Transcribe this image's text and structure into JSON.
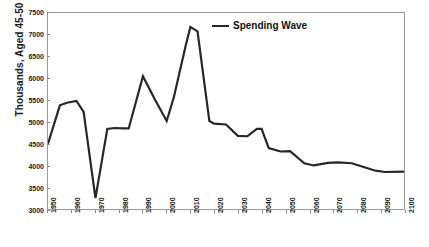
{
  "chart_data": {
    "type": "line",
    "title": "",
    "xlabel": "",
    "ylabel": "Thousands, Aged 45-50",
    "xlim": [
      1950,
      2100
    ],
    "ylim": [
      3000,
      7500
    ],
    "grid": false,
    "legend_position": "top-center",
    "legend": [
      "Spending Wave"
    ],
    "line_color": "#262626",
    "xticklabels": [
      "1950",
      "1960",
      "1970",
      "1980",
      "1990",
      "2000",
      "2010",
      "2020",
      "2030",
      "2040",
      "2050",
      "2060",
      "2070",
      "2080",
      "2090",
      "2100"
    ],
    "yticklabels": [
      "3000",
      "3500",
      "4000",
      "4500",
      "5000",
      "5500",
      "6000",
      "6500",
      "7000",
      "7500"
    ],
    "yticks": [
      3000,
      3500,
      4000,
      4500,
      5000,
      5500,
      6000,
      6500,
      7000,
      7500
    ],
    "xticks": [
      1950,
      1960,
      1970,
      1980,
      1990,
      2000,
      2010,
      2020,
      2030,
      2040,
      2050,
      2060,
      2070,
      2080,
      2090,
      2100
    ],
    "series": [
      {
        "name": "Spending Wave",
        "x": [
          1950,
          1955,
          1958,
          1962,
          1965,
          1970,
          1975,
          1978,
          1982,
          1984,
          1990,
          1995,
          2000,
          2003,
          2008,
          2010,
          2013,
          2018,
          2020,
          2025,
          2030,
          2034,
          2038,
          2040,
          2043,
          2048,
          2052,
          2058,
          2062,
          2068,
          2072,
          2078,
          2082,
          2088,
          2092,
          2100
        ],
        "values": [
          4500,
          5380,
          5440,
          5480,
          5230,
          3250,
          4840,
          4860,
          4850,
          4850,
          6050,
          5520,
          5020,
          5560,
          6750,
          7180,
          7080,
          5020,
          4960,
          4940,
          4680,
          4670,
          4840,
          4840,
          4400,
          4320,
          4330,
          4050,
          4000,
          4060,
          4070,
          4050,
          3980,
          3880,
          3850,
          3860
        ]
      }
    ]
  },
  "legend": {
    "label": "Spending Wave"
  },
  "axes": {
    "y_title": "Thousands, Aged 45-50"
  },
  "caption": {
    "text": ""
  }
}
